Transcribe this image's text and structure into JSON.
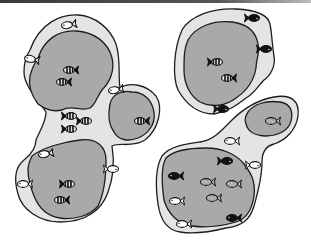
{
  "figure": {
    "colors": {
      "margin": "#e4e4e4",
      "core": "#a9a9a9",
      "outline": "#1e1e1e",
      "fish_dark": "#111111",
      "fish_light": "#ffffff",
      "fish_speckled": "#bdbdbd"
    },
    "fish_types": [
      "striped-dark",
      "outline-light",
      "solid-dark",
      "speckled"
    ],
    "patches": [
      {
        "id": "patch-left-cluster",
        "sub_areas": [
          "upper-left",
          "middle",
          "lower-left"
        ],
        "fish": [
          {
            "type": "outline-light",
            "x": 68,
            "y": 25,
            "rot": -10
          },
          {
            "type": "outline-light",
            "x": 31,
            "y": 59,
            "rot": 10
          },
          {
            "type": "striped-dark",
            "x": 70,
            "y": 70,
            "rot": 0
          },
          {
            "type": "striped-dark",
            "x": 63,
            "y": 82,
            "rot": 0
          },
          {
            "type": "outline-light",
            "x": 115,
            "y": 90,
            "rot": -10
          },
          {
            "type": "striped-dark",
            "x": 141,
            "y": 121,
            "rot": 0
          },
          {
            "type": "striped-dark",
            "x": 70,
            "y": 116,
            "rot": 180
          },
          {
            "type": "striped-dark",
            "x": 85,
            "y": 121,
            "rot": 180
          },
          {
            "type": "striped-dark",
            "x": 70,
            "y": 129,
            "rot": 180
          },
          {
            "type": "outline-light",
            "x": 45,
            "y": 154,
            "rot": -10
          },
          {
            "type": "outline-light",
            "x": 112,
            "y": 169,
            "rot": 180
          },
          {
            "type": "outline-light",
            "x": 24,
            "y": 184,
            "rot": 0
          },
          {
            "type": "striped-dark",
            "x": 68,
            "y": 184,
            "rot": 180
          },
          {
            "type": "striped-dark",
            "x": 61,
            "y": 200,
            "rot": 0
          }
        ]
      },
      {
        "id": "patch-top-right",
        "fish": [
          {
            "type": "solid-dark",
            "x": 253,
            "y": 18,
            "rot": 180
          },
          {
            "type": "solid-dark",
            "x": 265,
            "y": 49,
            "rot": 180
          },
          {
            "type": "striped-dark",
            "x": 216,
            "y": 62,
            "rot": 180
          },
          {
            "type": "striped-dark",
            "x": 228,
            "y": 78,
            "rot": 0
          },
          {
            "type": "solid-dark",
            "x": 222,
            "y": 109,
            "rot": 180
          }
        ]
      },
      {
        "id": "patch-bottom-right",
        "fish": [
          {
            "type": "speckled",
            "x": 272,
            "y": 121,
            "rot": 0
          },
          {
            "type": "outline-light",
            "x": 231,
            "y": 141,
            "rot": 0
          },
          {
            "type": "solid-dark",
            "x": 226,
            "y": 161,
            "rot": 180
          },
          {
            "type": "outline-light",
            "x": 254,
            "y": 165,
            "rot": 180
          },
          {
            "type": "solid-dark",
            "x": 175,
            "y": 176,
            "rot": 0
          },
          {
            "type": "speckled",
            "x": 207,
            "y": 182,
            "rot": 0
          },
          {
            "type": "speckled",
            "x": 233,
            "y": 184,
            "rot": 0
          },
          {
            "type": "outline-light",
            "x": 176,
            "y": 201,
            "rot": 0
          },
          {
            "type": "speckled",
            "x": 213,
            "y": 198,
            "rot": 0
          },
          {
            "type": "outline-light",
            "x": 183,
            "y": 224,
            "rot": 0
          },
          {
            "type": "solid-dark",
            "x": 233,
            "y": 218,
            "rot": 0
          }
        ]
      }
    ]
  }
}
